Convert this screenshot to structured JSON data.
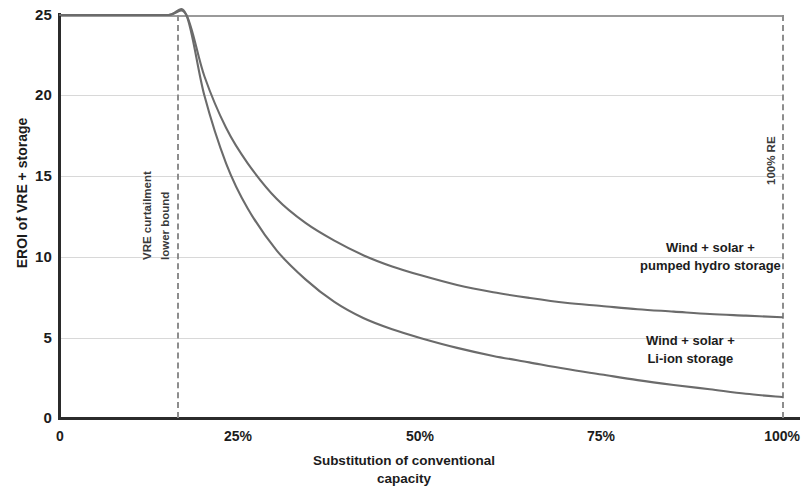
{
  "chart_data": {
    "type": "line",
    "title": "",
    "xlabel": "Substitution of conventional capacity",
    "ylabel": "EROI of VRE + storage",
    "xlim": [
      0,
      100
    ],
    "ylim": [
      0,
      25
    ],
    "grid": true,
    "legend_position": "inline-right",
    "x_tick_labels": [
      "0",
      "25%",
      "50%",
      "75%",
      "100%"
    ],
    "x_tick_values": [
      0,
      25,
      50,
      75,
      100
    ],
    "y_tick_labels": [
      "0",
      "5",
      "10",
      "15",
      "20",
      "25"
    ],
    "y_tick_values": [
      0,
      5,
      10,
      15,
      20,
      25
    ],
    "annotations": [
      {
        "name": "vre-curtailment-lower-bound",
        "label_line_1": "VRE curtailment",
        "label_line_2": "lower bound",
        "x": 17.5,
        "style": "dashed-vertical"
      },
      {
        "name": "hundred-percent-re",
        "label_line_1": "100% RE",
        "label_line_2": "",
        "x": 100,
        "style": "dashed-vertical"
      }
    ],
    "series": [
      {
        "name": "Wind + solar + pumped hydro storage",
        "label_line_1": "Wind + solar +",
        "label_line_2": "pumped hydro storage",
        "color": "#6b6b6b",
        "x": [
          0,
          5,
          10,
          15,
          17.5,
          20,
          23,
          26,
          30,
          34,
          38,
          42,
          46,
          50,
          55,
          60,
          65,
          70,
          75,
          80,
          85,
          90,
          95,
          100
        ],
        "y": [
          25,
          25,
          25,
          25,
          25,
          21.2,
          18.0,
          15.8,
          13.6,
          12.1,
          11.0,
          10.1,
          9.4,
          8.85,
          8.25,
          7.8,
          7.45,
          7.15,
          6.95,
          6.75,
          6.6,
          6.45,
          6.35,
          6.25
        ]
      },
      {
        "name": "Wind + solar + Li-ion storage",
        "label_line_1": "Wind + solar +",
        "label_line_2": "Li-ion storage",
        "color": "#6b6b6b",
        "x": [
          0,
          5,
          10,
          15,
          17.5,
          20,
          23,
          26,
          30,
          34,
          38,
          42,
          46,
          50,
          55,
          60,
          65,
          70,
          75,
          80,
          85,
          90,
          95,
          100
        ],
        "y": [
          25,
          25,
          25,
          25,
          25,
          20.0,
          15.8,
          13.0,
          10.4,
          8.6,
          7.2,
          6.2,
          5.5,
          4.95,
          4.35,
          3.85,
          3.45,
          3.05,
          2.7,
          2.35,
          2.05,
          1.78,
          1.5,
          1.3
        ]
      }
    ],
    "colors": {
      "axis": "#2b2b2b",
      "gridline": "#d8d8d8",
      "curve": "#6b6b6b",
      "dashed_annotation": "#8d8d8d",
      "text": "#1c1c1c"
    }
  }
}
